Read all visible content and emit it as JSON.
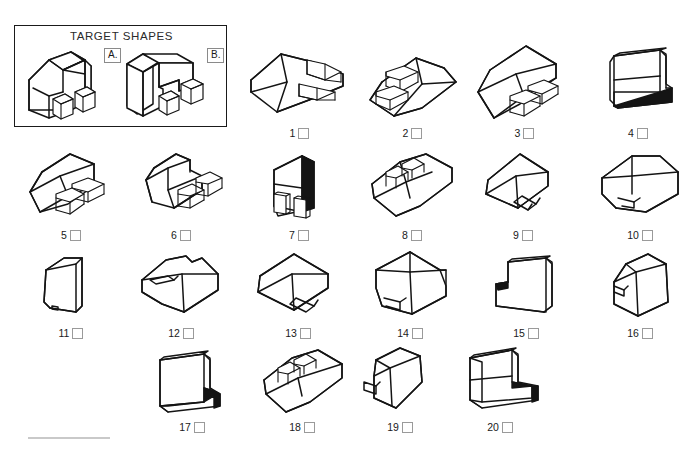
{
  "worksheet": {
    "target_panel": {
      "title": "TARGET SHAPES",
      "letters": [
        {
          "id": "A",
          "label": "A."
        },
        {
          "id": "B",
          "label": "B."
        }
      ]
    },
    "instructions_visible": false,
    "checkbox_state": "unchecked",
    "items": [
      {
        "number": "1",
        "checkbox": ""
      },
      {
        "number": "2",
        "checkbox": ""
      },
      {
        "number": "3",
        "checkbox": ""
      },
      {
        "number": "4",
        "checkbox": ""
      },
      {
        "number": "5",
        "checkbox": ""
      },
      {
        "number": "6",
        "checkbox": ""
      },
      {
        "number": "7",
        "checkbox": ""
      },
      {
        "number": "8",
        "checkbox": ""
      },
      {
        "number": "9",
        "checkbox": ""
      },
      {
        "number": "10",
        "checkbox": ""
      },
      {
        "number": "11",
        "checkbox": ""
      },
      {
        "number": "12",
        "checkbox": ""
      },
      {
        "number": "13",
        "checkbox": ""
      },
      {
        "number": "14",
        "checkbox": ""
      },
      {
        "number": "15",
        "checkbox": ""
      },
      {
        "number": "16",
        "checkbox": ""
      },
      {
        "number": "17",
        "checkbox": ""
      },
      {
        "number": "18",
        "checkbox": ""
      },
      {
        "number": "19",
        "checkbox": ""
      },
      {
        "number": "20",
        "checkbox": ""
      }
    ],
    "colors": {
      "ink": "#141414",
      "page": "#ffffff",
      "checkbox_border": "#9a9a9a",
      "footer_rule": "#c9c9c9"
    }
  }
}
